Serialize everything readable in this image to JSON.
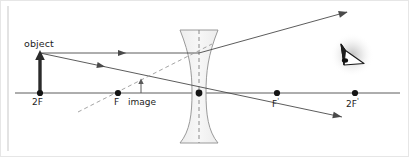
{
  "figure": {
    "type": "optics-ray-diagram",
    "background_color": "#ffffff",
    "ink_color": "#3a3a3a",
    "label_color": "#1c1c1c",
    "lens_fill": "#f2f2f2",
    "lens_stroke": "#8c8c8c",
    "dash_color": "#9a9a9a",
    "frame_color": "#e3e3e3",
    "left_rule_color": "#dcdcdc"
  },
  "labels": {
    "object": "object",
    "focal_left": "F",
    "image": "image",
    "double_focal_left": "2F",
    "focal_right": "F",
    "focal_right_prime": "'",
    "double_focal_right": "2F",
    "double_focal_right_prime": "'"
  },
  "icons": {
    "eye": "eye-icon",
    "object_arrow": "object-arrow-icon",
    "image_arrow": "image-arrow-icon",
    "lens": "concave-lens-icon"
  },
  "optical_axis": {
    "y": 93,
    "x_start": 15,
    "x_end": 400
  },
  "points": [
    {
      "name": "2F",
      "x": 40,
      "y": 93,
      "label": "2F"
    },
    {
      "name": "F",
      "x": 118,
      "y": 93,
      "label": "F"
    },
    {
      "name": "O",
      "x": 199,
      "y": 93,
      "label": ""
    },
    {
      "name": "F'",
      "x": 277,
      "y": 93,
      "label": "F'"
    },
    {
      "name": "2F'",
      "x": 355,
      "y": 93,
      "label": "2F'"
    }
  ],
  "object": {
    "base_x": 40,
    "base_y": 93,
    "tip_y": 53,
    "height_px": 40,
    "orientation": "upright"
  },
  "image": {
    "base_x": 141,
    "base_y": 93,
    "tip_y": 81,
    "height_px": 12,
    "orientation": "upright",
    "nature": "virtual-erect-diminished"
  },
  "lens": {
    "center_x": 199,
    "top_y": 30,
    "bottom_y": 143,
    "half_width_edge": 19,
    "half_width_waist": 7,
    "shape": "biconcave"
  },
  "rays": [
    {
      "name": "parallel-incident-ray",
      "style": "solid",
      "from_x": 40,
      "from_y": 53,
      "to_x": 199,
      "to_y": 53
    },
    {
      "name": "refracted-diverging-ray",
      "style": "solid",
      "from_x": 199,
      "from_y": 53,
      "to_x": 347,
      "to_y": 12
    },
    {
      "name": "chief-ray-through-center",
      "style": "solid",
      "from_x": 40,
      "from_y": 53,
      "to_x": 342,
      "to_y": 117
    },
    {
      "name": "virtual-ray-extension",
      "style": "dashed",
      "from_x": 78,
      "from_y": 112,
      "to_x": 210,
      "to_y": 45
    }
  ],
  "arrowheads": [
    {
      "name": "parallel-ray-arrowhead",
      "x": 118,
      "y": 53,
      "angle_deg": 0
    },
    {
      "name": "chief-ray-arrowhead",
      "x": 97,
      "y": 65,
      "angle_deg": 12
    },
    {
      "name": "upper-exit-arrowhead",
      "x": 347,
      "y": 12,
      "angle_deg": -15
    },
    {
      "name": "lower-exit-arrowhead",
      "x": 342,
      "y": 117,
      "angle_deg": 12
    }
  ],
  "eye": {
    "x": 352,
    "y": 55,
    "glow_radius": 22,
    "description": "observer eye viewing through lens"
  }
}
